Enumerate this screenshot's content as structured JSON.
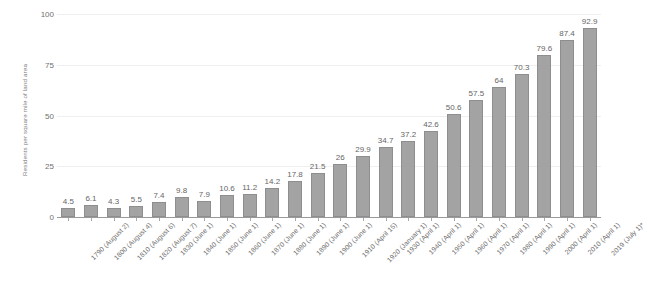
{
  "chart_data": {
    "type": "bar",
    "title": "",
    "subtitle": "",
    "xlabel": "",
    "ylabel": "Residents per square mile of land area",
    "ylim": [
      0,
      100
    ],
    "yticks": [
      0,
      25,
      50,
      75,
      100
    ],
    "grid": true,
    "legend": "none",
    "bar_color": "#a3a3a3",
    "bar_border_color": "#8e8e8e",
    "footnote_marker": "*",
    "categories": [
      "1790 (August 2)",
      "1800 (August 4)",
      "1810 (August 6)",
      "1820 (August 7)",
      "1830 (June 1)",
      "1840 (June 1)",
      "1850 (June 1)",
      "1860 (June 1)",
      "1870 (June 1)",
      "1880 (June 1)",
      "1890 (June 1)",
      "1900 (June 1)",
      "1910 (April 15)",
      "1920 (January 1)",
      "1930 (April 1)",
      "1940 (April 1)",
      "1950 (April 1)",
      "1960 (April 1)",
      "1970 (April 1)",
      "1980 (April 1)",
      "1990 (April 1)",
      "2000 (April 1)",
      "2010 (April 1)",
      "2019 (July 1)*"
    ],
    "values": [
      4.5,
      6.1,
      4.3,
      5.5,
      7.4,
      9.8,
      7.9,
      10.6,
      11.2,
      14.2,
      17.8,
      21.5,
      26,
      29.9,
      34.7,
      37.2,
      42.6,
      50.6,
      57.5,
      64,
      70.3,
      79.6,
      87.4,
      92.9
    ],
    "value_labels": [
      "4.5",
      "6.1",
      "4.3",
      "5.5",
      "7.4",
      "9.8",
      "7.9",
      "10.6",
      "11.2",
      "14.2",
      "17.8",
      "21.5",
      "26",
      "29.9",
      "34.7",
      "37.2",
      "42.6",
      "50.6",
      "57.5",
      "64",
      "70.3",
      "79.6",
      "87.4",
      "92.9"
    ],
    "ytick_labels": [
      "0",
      "25",
      "50",
      "75",
      "100"
    ]
  }
}
